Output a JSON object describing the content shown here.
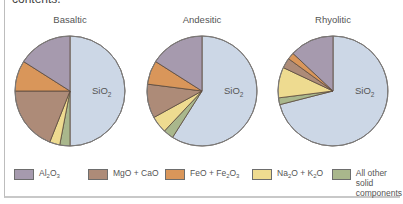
{
  "header": {
    "truncated_text": "contents."
  },
  "chart_data": {
    "type": "pie",
    "title": "",
    "categories": [
      "SiO2",
      "Al2O3",
      "FeO + Fe2O3",
      "MgO + CaO",
      "Na2O + K2O",
      "All other solid components"
    ],
    "colors": {
      "SiO2": "#ccd7e6",
      "Al2O3": "#a69aae",
      "FeO + Fe2O3": "#d9965a",
      "MgO + CaO": "#ad8b78",
      "Na2O + K2O": "#eedb90",
      "All other solid components": "#a9b78c"
    },
    "series": [
      {
        "name": "Basaltic",
        "values": {
          "SiO2": 50,
          "Al2O3": 16,
          "FeO + Fe2O3": 9,
          "MgO + CaO": 19,
          "Na2O + K2O": 3,
          "All other solid components": 3
        }
      },
      {
        "name": "Andesitic",
        "values": {
          "SiO2": 59,
          "Al2O3": 16,
          "FeO + Fe2O3": 7,
          "MgO + CaO": 10,
          "Na2O + K2O": 5,
          "All other solid components": 3
        }
      },
      {
        "name": "Rhyolitic",
        "values": {
          "SiO2": 71,
          "Al2O3": 13,
          "FeO + Fe2O3": 2,
          "MgO + CaO": 3,
          "Na2O + K2O": 9,
          "All other solid components": 2
        }
      }
    ],
    "slice_label": "SiO2",
    "legend_position": "bottom"
  },
  "pies": [
    {
      "title": "Basaltic",
      "cx": 70,
      "cy": 91,
      "r": 55
    },
    {
      "title": "Andesitic",
      "cx": 202,
      "cy": 91,
      "r": 55
    },
    {
      "title": "Rhyolitic",
      "cx": 333,
      "cy": 91,
      "r": 55
    }
  ],
  "legend": [
    {
      "key": "Al2O3",
      "label_html": "Al<sub>2</sub>O<sub>3</sub>",
      "x": 0
    },
    {
      "key": "MgO + CaO",
      "label_html": "MgO + CaO",
      "x": 74
    },
    {
      "key": "FeO + Fe2O3",
      "label_html": "FeO + Fe<sub>2</sub>O<sub>3</sub>",
      "x": 151
    },
    {
      "key": "Na2O + K2O",
      "label_html": "Na<sub>2</sub>O + K<sub>2</sub>O",
      "x": 238
    },
    {
      "key": "All other solid components",
      "label_html": "All other solid\ncomponents",
      "x": 318
    }
  ]
}
